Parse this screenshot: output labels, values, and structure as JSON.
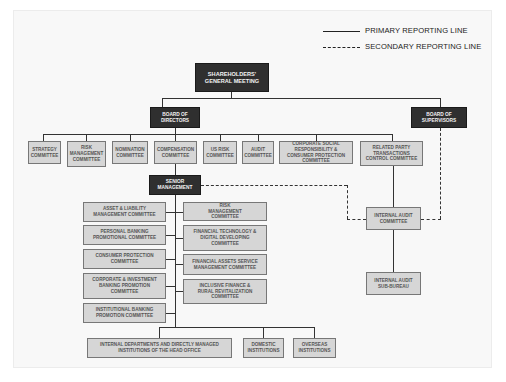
{
  "legend": {
    "primary": "PRIMARY REPORTING LINE",
    "secondary": "SECONDARY REPORTING LINE"
  },
  "nodes": {
    "shareholders": "SHAREHOLDERS' GENERAL MEETING",
    "board_directors": "BOARD OF DIRECTORS",
    "board_supervisors": "BOARD OF SUPERVISORS",
    "senior_management": "SENIOR MANAGEMENT",
    "internal_audit_committee": "INTERNAL AUDIT COMMITTEE",
    "internal_audit_sub_bureau": "INTERNAL AUDIT SUB-BUREAU"
  },
  "board_committees": [
    "STRATEGY COMMITTEE",
    "RISK MANAGEMENT COMMITTEE",
    "NOMINATION COMMITTEE",
    "COMPENSATION COMMITTEE",
    "US RISK COMMITTEE",
    "AUDIT COMMITTEE",
    "CORPORATE SOCIAL RESPONSIBILITY & CONSUMER PROTECTION COMMITTEE",
    "RELATED PARTY TRANSACTIONS CONTROL COMMITTEE"
  ],
  "mgmt_committees_left": [
    "ASSET & LIABILITY MANAGEMENT COMMITTEE",
    "PERSONAL BANKING PROMOTIONAL COMMITTEE",
    "CONSUMER PROTECTION COMMITTEE",
    "CORPORATE & INVESTMENT BANKING PROMOTION COMMITTEE",
    "INSTITUTIONAL BANKING PROMOTION COMMITTEE"
  ],
  "mgmt_committees_right": [
    "RISK MANAGEMENT COMMITTEE",
    "FINANCIAL TECHNOLOGY & DIGITAL DEVELOPING COMMITTEE",
    "FINANCIAL ASSETS SERVICE MANAGEMENT COMMITTEE",
    "INCLUSIVE FINANCE & RURAL REVITALIZATION COMMITTEE"
  ],
  "institutions": [
    "INTERNAL DEPARTMENTS AND DIRECTLY MANAGED INSTITUTIONS OF THE HEAD OFFICE",
    "DOMESTIC INSTITUTIONS",
    "OVERSEAS INSTITUTIONS"
  ]
}
